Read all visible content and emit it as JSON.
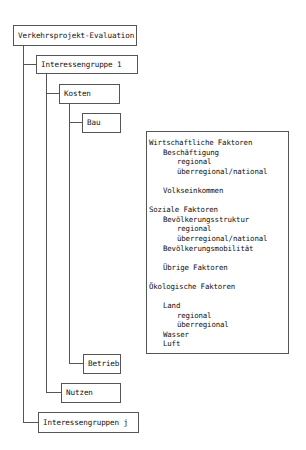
{
  "diagram": {
    "root": "Verkehrsprojekt-Evaluation",
    "group_first": "Interessengruppe 1",
    "group_last": "Interessengruppen j",
    "cost": "Kosten",
    "cost_construction": "Bau",
    "cost_operation": "Betrieb",
    "benefit": "Nutzen"
  },
  "factors": {
    "lines": [
      {
        "level": 0,
        "text": "Wirtschaftliche Faktoren"
      },
      {
        "level": 1,
        "text": "Beschäftigung"
      },
      {
        "level": 2,
        "text": "regional"
      },
      {
        "level": 2,
        "text": "überregional/national"
      },
      {
        "level": 0,
        "text": ""
      },
      {
        "level": 1,
        "text": "Volkseinkommen"
      },
      {
        "level": 0,
        "text": ""
      },
      {
        "level": 0,
        "text": "Soziale Faktoren"
      },
      {
        "level": 1,
        "text": "Bevölkerungsstruktur"
      },
      {
        "level": 2,
        "text": "regional"
      },
      {
        "level": 2,
        "text": "überregional/national"
      },
      {
        "level": 1,
        "text": "Bevölkerungsmobilität"
      },
      {
        "level": 0,
        "text": ""
      },
      {
        "level": 1,
        "text": "Übrige Faktoren"
      },
      {
        "level": 0,
        "text": ""
      },
      {
        "level": 0,
        "text": "Ökologische Faktoren"
      },
      {
        "level": 0,
        "text": ""
      },
      {
        "level": 1,
        "text": "Land"
      },
      {
        "level": 2,
        "text": "regional"
      },
      {
        "level": 2,
        "text": "überregional"
      },
      {
        "level": 1,
        "text": "Wasser"
      },
      {
        "level": 1,
        "text": "Luft"
      }
    ]
  }
}
